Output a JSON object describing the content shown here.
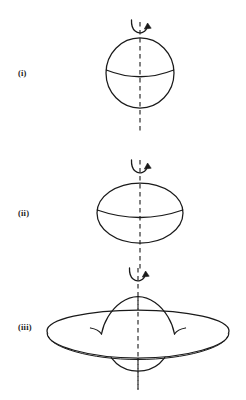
{
  "figure": {
    "background_color": "#ffffff",
    "ink_color": "#1a1a1a",
    "panels": [
      {
        "id": "panel-i",
        "label": "(i)",
        "shape_name": "sphere",
        "description": "Spherical body with vertical rotation axis",
        "axis": {
          "type": "dashed-vertical",
          "x": 140,
          "y_top": 22,
          "y_bottom": 131
        },
        "rotation_arrow": {
          "name": "rotation-arrow",
          "direction": "counterclockwise-about-axis",
          "center_x": 140,
          "center_y": 26
        },
        "outline": {
          "cx": 140,
          "cy": 73,
          "rx": 34,
          "ry": 35
        },
        "equator": {
          "name": "equator-arc",
          "x_left": 106,
          "x_right": 174,
          "y": 73,
          "sag": 7
        },
        "label_pos": {
          "x": 18,
          "y": 76
        }
      },
      {
        "id": "panel-ii",
        "label": "(ii)",
        "shape_name": "oblate-spheroid",
        "description": "Flattened (oblate) spheroid, moderate rotation",
        "axis": {
          "type": "dashed-vertical",
          "x": 140,
          "y_top": 160,
          "y_bottom": 270
        },
        "rotation_arrow": {
          "name": "rotation-arrow",
          "direction": "counterclockwise-about-axis",
          "center_x": 140,
          "center_y": 166
        },
        "outline": {
          "cx": 140,
          "cy": 213,
          "rx": 43,
          "ry": 30
        },
        "equator": {
          "name": "equator-arc",
          "x_left": 97,
          "x_right": 183,
          "y": 213,
          "sag": 8
        },
        "label_pos": {
          "x": 18,
          "y": 216
        }
      },
      {
        "id": "panel-iii",
        "label": "(iii)",
        "shape_name": "disc-with-central-bulge",
        "description": "Highly flattened disc with a central bulge, rapid rotation",
        "axis": {
          "type": "dashed-vertical",
          "x": 138,
          "y_top": 268,
          "y_bottom": 390
        },
        "rotation_arrow": {
          "name": "rotation-arrow",
          "direction": "counterclockwise-about-axis",
          "center_x": 138,
          "center_y": 274
        },
        "disc": {
          "cx": 138,
          "cy": 334,
          "rx": 91,
          "ry": 21,
          "rim_thickness": 7
        },
        "bulge": {
          "top_peak_y": 299,
          "bottom_depth_y": 369,
          "half_width": 38
        },
        "label_pos": {
          "x": 18,
          "y": 330
        }
      }
    ]
  }
}
